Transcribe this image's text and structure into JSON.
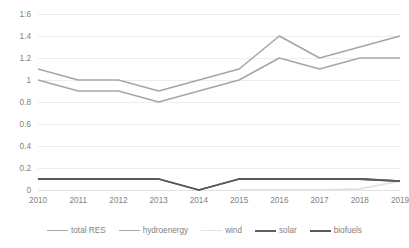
{
  "chart_data": {
    "type": "line",
    "title": "",
    "xlabel": "",
    "ylabel": "",
    "categories": [
      "2010",
      "2011",
      "2012",
      "2013",
      "2014",
      "2015",
      "2016",
      "2017",
      "2018",
      "2019"
    ],
    "ylim": [
      0,
      1.6
    ],
    "yticks": [
      "0",
      "0.2",
      "0.4",
      "0.6",
      "0.8",
      "1",
      "1.2",
      "1.4",
      "1.6"
    ],
    "ytick_values": [
      0,
      0.2,
      0.4,
      0.6,
      0.8,
      1.0,
      1.2,
      1.4,
      1.6
    ],
    "grid": true,
    "legend_position": "bottom",
    "series": [
      {
        "name": "total RES",
        "color": "#a6a6a6",
        "width": 1.6,
        "values": [
          1.1,
          1.0,
          1.0,
          0.9,
          1.0,
          1.1,
          1.4,
          1.2,
          1.3,
          1.4
        ]
      },
      {
        "name": "hydroenergy",
        "color": "#a6a6a6",
        "width": 1.6,
        "values": [
          1.0,
          0.9,
          0.9,
          0.8,
          0.9,
          1.0,
          1.2,
          1.1,
          1.2,
          1.2
        ]
      },
      {
        "name": "wind",
        "color": "#e2e2e2",
        "width": 1.8,
        "values": [
          null,
          null,
          null,
          null,
          null,
          0.0,
          0.0,
          0.0,
          0.01,
          0.08
        ]
      },
      {
        "name": "solar",
        "color": "#606060",
        "width": 1.8,
        "values": [
          0.1,
          0.1,
          0.1,
          0.1,
          0.0,
          0.1,
          0.1,
          0.1,
          0.1,
          0.08
        ]
      },
      {
        "name": "biofuels",
        "color": "#595959",
        "width": 1.8,
        "values": [
          0.1,
          0.1,
          0.1,
          0.1,
          0.0,
          0.1,
          0.1,
          0.1,
          0.1,
          0.08
        ]
      }
    ]
  },
  "legend": {
    "items": [
      {
        "label": "total RES",
        "color": "#a6a6a6",
        "width": 1.6
      },
      {
        "label": "hydroenergy",
        "color": "#a6a6a6",
        "width": 1.8
      },
      {
        "label": "wind",
        "color": "#e2e2e2",
        "width": 1.8
      },
      {
        "label": "solar",
        "color": "#606060",
        "width": 2.0
      },
      {
        "label": "biofuels",
        "color": "#595959",
        "width": 2.0
      }
    ]
  }
}
